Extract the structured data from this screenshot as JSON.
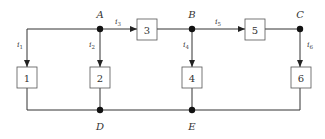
{
  "diagram": {
    "type": "circuit-network",
    "nodes": [
      {
        "id": "A",
        "label": "A"
      },
      {
        "id": "B",
        "label": "B"
      },
      {
        "id": "C",
        "label": "C"
      },
      {
        "id": "D",
        "label": "D"
      },
      {
        "id": "E",
        "label": "E"
      }
    ],
    "elements": [
      {
        "id": "1",
        "label": "1"
      },
      {
        "id": "2",
        "label": "2"
      },
      {
        "id": "3",
        "label": "3"
      },
      {
        "id": "4",
        "label": "4"
      },
      {
        "id": "5",
        "label": "5"
      },
      {
        "id": "6",
        "label": "6"
      }
    ],
    "currents": [
      {
        "id": "i1",
        "base": "i",
        "sub": "1"
      },
      {
        "id": "i2",
        "base": "i",
        "sub": "2"
      },
      {
        "id": "i3",
        "base": "i",
        "sub": "3"
      },
      {
        "id": "i4",
        "base": "i",
        "sub": "4"
      },
      {
        "id": "i5",
        "base": "i",
        "sub": "5"
      },
      {
        "id": "i6",
        "base": "i",
        "sub": "6"
      }
    ]
  }
}
